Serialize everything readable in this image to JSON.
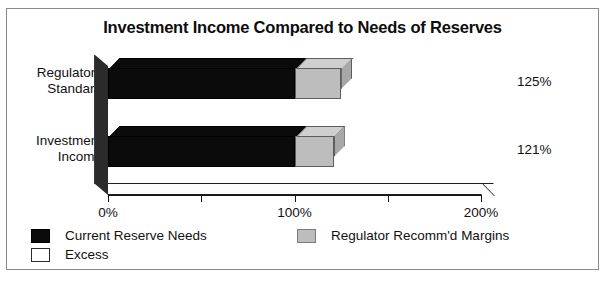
{
  "chart_data": {
    "type": "bar",
    "orientation": "horizontal",
    "stacked": true,
    "title": "Investment Income Compared to Needs of Reserves",
    "xlabel": "",
    "ylabel": "",
    "categories": [
      "Regulatory Standard",
      "Investment Income"
    ],
    "category_lines": [
      [
        "Regulatory",
        "Standard"
      ],
      [
        "Investment",
        "Income"
      ]
    ],
    "series": [
      {
        "name": "Current Reserve Needs",
        "color": "#0b0b0b",
        "values": [
          100,
          100
        ]
      },
      {
        "name": "Excess",
        "color": "#ffffff",
        "values": [
          0,
          0
        ]
      },
      {
        "name": "Regulator Recomm'd Margins",
        "color": "#bdbdbd",
        "values": [
          25,
          21
        ]
      }
    ],
    "totals": [
      125,
      121
    ],
    "data_labels": [
      "125%",
      "121%"
    ],
    "xlim": [
      0,
      200
    ],
    "xticks": [
      0,
      50,
      100,
      150,
      200
    ],
    "xtick_labels": [
      "0%",
      "",
      "100%",
      "",
      "200%"
    ],
    "grid": false,
    "legend_position": "bottom",
    "style": "3d-perspective"
  },
  "legend": {
    "left_column": [
      {
        "label": "Current Reserve Needs",
        "swatch": "black"
      },
      {
        "label": "Excess",
        "swatch": "white"
      }
    ],
    "right_column": [
      {
        "label": "Regulator Recomm'd Margins",
        "swatch": "gray"
      }
    ]
  }
}
